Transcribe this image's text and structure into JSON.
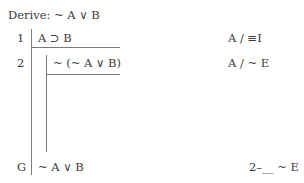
{
  "header": {
    "derive_label": "Derive: ~ A ∨ B"
  },
  "lines": [
    {
      "number": "1",
      "formula": "A ⊃ B",
      "justification": "A / ≡I"
    },
    {
      "number": "2",
      "formula": "~ (~ A ∨ B)",
      "justification": "A / ~ E"
    },
    {
      "number": "G",
      "formula": "~ A ∨ B",
      "justification": "2–__ ~ E"
    }
  ]
}
